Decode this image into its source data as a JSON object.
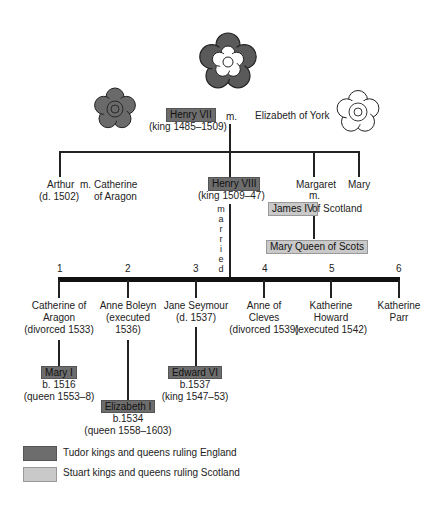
{
  "roses": [
    {
      "name": "tudor-rose-large",
      "fill": "#5a5a5a"
    },
    {
      "name": "red-rose-lancaster",
      "fill": "#6a6a6a"
    },
    {
      "name": "white-rose-york",
      "fill": "#ffffff"
    }
  ],
  "gen1": {
    "henry7": {
      "name": "Henry VII",
      "reign": "(king 1485–1509)"
    },
    "married": "m.",
    "spouse": "Elizabeth of York"
  },
  "gen2": {
    "arthur": {
      "name": "Arthur",
      "died": "(d. 1502)"
    },
    "arthur_m": "m.",
    "arthur_spouse_l1": "Catherine",
    "arthur_spouse_l2": "of Aragon",
    "henry8": {
      "name": "Henry VIII",
      "reign": "(king 1509–47)"
    },
    "married_vertical": [
      "m",
      "a",
      "r",
      "r",
      "i",
      "e",
      "d"
    ],
    "margaret": {
      "name": "Margaret",
      "m": "m.",
      "spouse": "James IV",
      "spouse_suffix": "of Scotland"
    },
    "mary_queen_of_scots": "Mary Queen of Scots",
    "mary": "Mary"
  },
  "wives": [
    {
      "num": "1",
      "l1": "Catherine of",
      "l2": "Aragon",
      "l3": "(divorced 1533)"
    },
    {
      "num": "2",
      "l1": "Anne Boleyn",
      "l2": "(executed",
      "l3": "1536)"
    },
    {
      "num": "3",
      "l1": "Jane Seymour",
      "l2": "(d. 1537)",
      "l3": ""
    },
    {
      "num": "4",
      "l1": "Anne  of",
      "l2": "Cleves",
      "l3": "(divorced 1539)"
    },
    {
      "num": "5",
      "l1": "Katherine",
      "l2": "Howard",
      "l3": "(executed 1542)"
    },
    {
      "num": "6",
      "l1": "Katherine",
      "l2": "Parr",
      "l3": ""
    }
  ],
  "children": {
    "mary1": {
      "name": "Mary I",
      "born": "b. 1516",
      "reign": "(queen  1553–8)"
    },
    "elizabeth1": {
      "name": "Elizabeth I",
      "born": "b.1534",
      "reign": "(queen  1558–1603)"
    },
    "edward6": {
      "name": "Edward VI",
      "born": "b.1537",
      "reign": "(king  1547–53)"
    }
  },
  "legend": [
    {
      "label": "Tudor kings and queens ruling England",
      "color": "#6d6d6d"
    },
    {
      "label": "Stuart kings and queens ruling Scotland",
      "color": "#c9c9c9"
    }
  ]
}
